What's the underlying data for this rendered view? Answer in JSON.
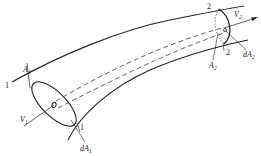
{
  "diagram": {
    "labels": {
      "section1_top": "1",
      "section1_bottom": "1",
      "section2_top": "2",
      "section2_bottom": "2",
      "area1": {
        "base": "A",
        "sub": "1"
      },
      "area2": {
        "base": "A",
        "sub": "2"
      },
      "velocity1": {
        "base": "V",
        "sub": "1"
      },
      "velocity2": {
        "base": "V",
        "sub": "2"
      },
      "elem_area1": {
        "base": "dA",
        "sub": "1"
      },
      "elem_area2": {
        "base": "dA",
        "sub": "2"
      }
    },
    "colors": {
      "line": "#222222",
      "background": "#ffffff"
    }
  }
}
